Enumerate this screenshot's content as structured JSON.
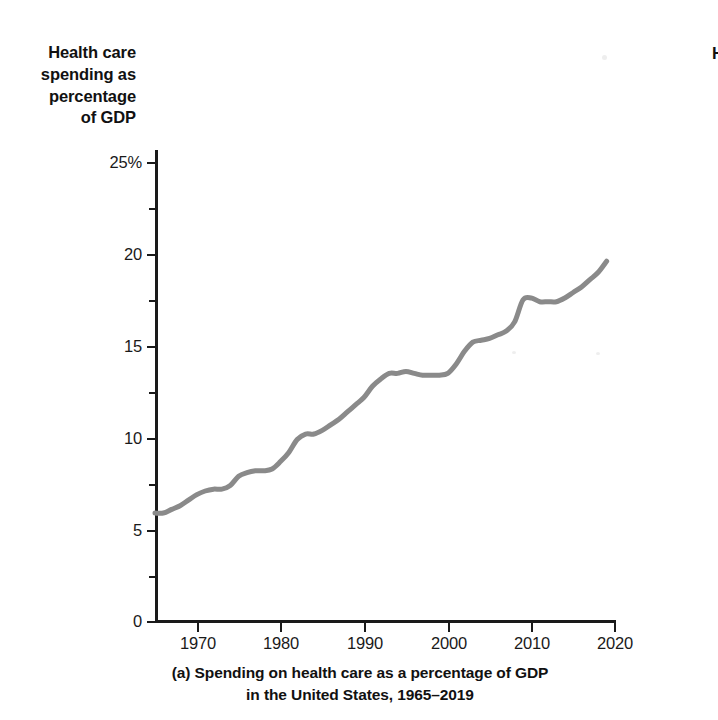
{
  "figure": {
    "panel_letter": "(a)",
    "caption_line_1": "(a) Spending on health care as a percentage of GDP",
    "caption_line_2": "in the United States, 1965–2019",
    "y_axis_title": "Health care\nspending as\npercentage\nof GDP",
    "clipped_neighbor_text": "H"
  },
  "colors": {
    "line": "#8a8a8a",
    "axis": "#1a1a1a",
    "text": "#111111",
    "background": "#ffffff"
  },
  "axes": {
    "y_tick_labels": [
      "25%",
      "20",
      "15",
      "10",
      "5",
      "0"
    ],
    "x_tick_labels": [
      "1970",
      "1980",
      "1990",
      "2000",
      "2010",
      "2020"
    ]
  },
  "chart_data": {
    "type": "line",
    "title": "(a) Spending on health care as a percentage of GDP in the United States, 1965–2019",
    "xlabel": "",
    "ylabel": "Health care spending as percentage of GDP",
    "xlim": [
      1965,
      2020
    ],
    "ylim": [
      0,
      25
    ],
    "x_ticks": [
      1970,
      1980,
      1990,
      2000,
      2010,
      2020
    ],
    "y_ticks": [
      0,
      5,
      10,
      15,
      20,
      25
    ],
    "y_minor_ticks": [
      2.5,
      7.5,
      12.5,
      17.5,
      22.5
    ],
    "y_tick_suffix_on_top": "%",
    "grid": false,
    "legend": false,
    "series": [
      {
        "name": "Health care spending as percentage of GDP",
        "color": "#8a8a8a",
        "x": [
          1965,
          1966,
          1967,
          1968,
          1969,
          1970,
          1971,
          1972,
          1973,
          1974,
          1975,
          1976,
          1977,
          1978,
          1979,
          1980,
          1981,
          1982,
          1983,
          1984,
          1985,
          1986,
          1987,
          1988,
          1989,
          1990,
          1991,
          1992,
          1993,
          1994,
          1995,
          1996,
          1997,
          1998,
          1999,
          2000,
          2001,
          2002,
          2003,
          2004,
          2005,
          2006,
          2007,
          2008,
          2009,
          2010,
          2011,
          2012,
          2013,
          2014,
          2015,
          2016,
          2017,
          2018,
          2019
        ],
        "y": [
          5.9,
          5.9,
          6.1,
          6.3,
          6.6,
          6.9,
          7.1,
          7.2,
          7.2,
          7.4,
          7.9,
          8.1,
          8.2,
          8.2,
          8.3,
          8.7,
          9.2,
          9.9,
          10.2,
          10.2,
          10.4,
          10.7,
          11.0,
          11.4,
          11.8,
          12.2,
          12.8,
          13.2,
          13.5,
          13.5,
          13.6,
          13.5,
          13.4,
          13.4,
          13.4,
          13.5,
          14.0,
          14.7,
          15.2,
          15.3,
          15.4,
          15.6,
          15.8,
          16.3,
          17.5,
          17.6,
          17.4,
          17.4,
          17.4,
          17.6,
          17.9,
          18.2,
          18.6,
          19.0,
          19.6
        ]
      }
    ]
  }
}
